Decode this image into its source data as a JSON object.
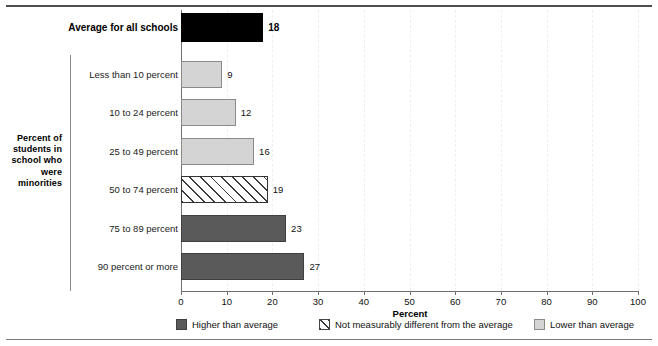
{
  "chart_data": {
    "type": "bar",
    "orientation": "horizontal",
    "title": "",
    "xlabel": "Percent",
    "ylabel": "Percent of students in school who were minorities",
    "xlim": [
      0,
      100
    ],
    "xticks": [
      0,
      10,
      20,
      30,
      40,
      50,
      60,
      70,
      80,
      90,
      100
    ],
    "xtick_labels": [
      "0",
      "10",
      "20",
      "30",
      "40",
      "50",
      "60",
      "70",
      "80",
      "90",
      "100"
    ],
    "grid": true,
    "legend_position": "bottom",
    "average_row": {
      "label": "Average for all schools",
      "value": 18,
      "value_label": "18",
      "style": "black"
    },
    "categories": [
      "Less than 10 percent",
      "10 to 24 percent",
      "25 to 49 percent",
      "50 to 74 percent",
      "75 to 89 percent",
      "90 percent or more"
    ],
    "values": [
      9,
      12,
      16,
      19,
      23,
      27
    ],
    "value_labels": [
      "9",
      "12",
      "16",
      "19",
      "23",
      "27"
    ],
    "bar_styles": [
      "light",
      "light",
      "light",
      "hatch",
      "dark",
      "dark"
    ],
    "legend": [
      {
        "label": "Higher than average",
        "style": "dark"
      },
      {
        "label": "Not measurably different from the average",
        "style": "hatch"
      },
      {
        "label": "Lower than average",
        "style": "light"
      }
    ],
    "colors": {
      "higher_than_average": "#5a5a5a",
      "lower_than_average": "#d4d4d4",
      "not_different_fill": "#ffffff",
      "average_bar": "#000000",
      "axis": "#6f6f6f",
      "gridline": "#efefef"
    }
  },
  "axis_title_lines": [
    "Percent of",
    "students in",
    "school who",
    "were",
    "minorities"
  ]
}
